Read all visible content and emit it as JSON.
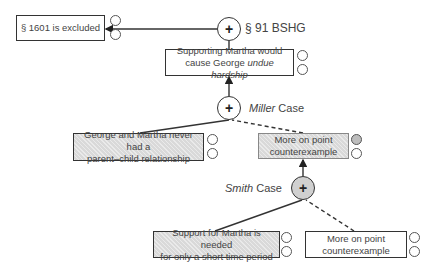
{
  "diagram": {
    "nodes": {
      "top_conclusion": {
        "text": "§ 1601 is excluded"
      },
      "bshg_rule": {
        "symbol": "+",
        "label": "§ 91 BSHG"
      },
      "hardship": {
        "text_plain": "Supporting Martha would cause George ",
        "text_italic": "undue hardship",
        "line1": "Supporting Martha would",
        "line2_plain": "cause George ",
        "line2_italic": "undue hardship"
      },
      "miller": {
        "symbol": "+",
        "label_italic": "Miller",
        "label_plain": " Case"
      },
      "no_relationship": {
        "line1": "George and Martha never had a",
        "line2": "parent–child relationship"
      },
      "counterexample_1": {
        "line1": "More on point",
        "line2": "counterexample"
      },
      "smith": {
        "symbol": "+",
        "label_italic": "Smith",
        "label_plain": " Case"
      },
      "short_time": {
        "line1": "Support for Martha is needed",
        "line2": "for only a short time period"
      },
      "counterexample_2": {
        "line1": "More on point",
        "line2": "counterexample"
      }
    },
    "colors": {
      "stroke": "#333333",
      "shaded_fill": "#d9d9d9",
      "filled_dot": "#bdbdbd"
    }
  }
}
